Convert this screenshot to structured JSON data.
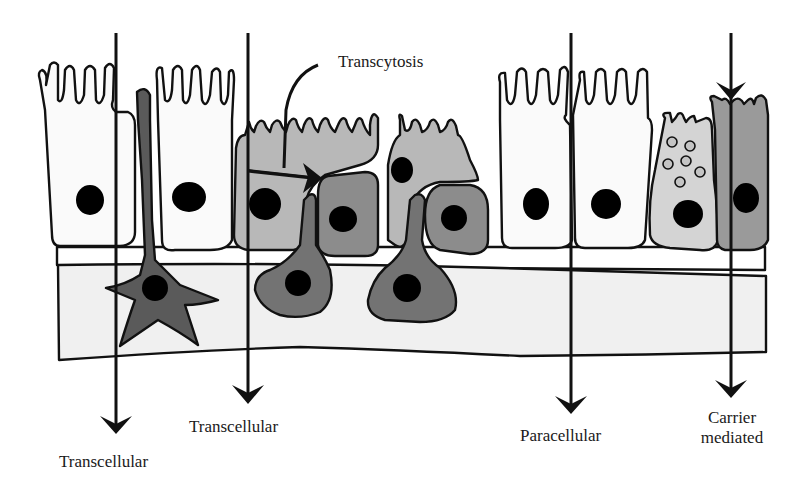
{
  "diagram": {
    "labels": {
      "transcytosis": "Transcytosis",
      "transcellular_1": "Transcellular",
      "transcellular_2": "Transcellular",
      "paracellular": "Paracellular",
      "carrier_line1": "Carrier",
      "carrier_line2": "mediated"
    },
    "colors": {
      "white_cell": "#fafafa",
      "light_gray_cell": "#b8b8b8",
      "medium_gray_cell": "#8c8c8c",
      "dark_cell": "#5a5a5a",
      "goblet_cell": "#d4d4d4",
      "carrier_cell": "#9a9a9a",
      "stroma": "#f0f0f0",
      "nucleus": "#000000",
      "outline": "#111111"
    },
    "routes": [
      {
        "name": "Transcellular",
        "x": 116
      },
      {
        "name": "Transcellular",
        "x": 248
      },
      {
        "name": "Paracellular",
        "x": 571
      },
      {
        "name": "Carrier mediated",
        "x": 731
      }
    ]
  }
}
